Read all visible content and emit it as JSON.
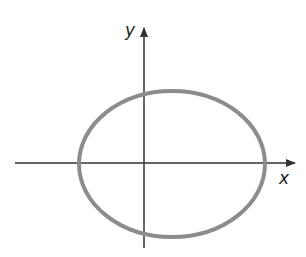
{
  "diagram": {
    "type": "ellipse-on-axes",
    "axes": {
      "x_label": "x",
      "y_label": "y",
      "color": "#333333"
    },
    "ellipse": {
      "stroke_color": "#8c8c8c",
      "stroke_width": 4,
      "center_px": [
        172,
        164
      ],
      "rx_px": 93,
      "ry_px": 73
    }
  }
}
